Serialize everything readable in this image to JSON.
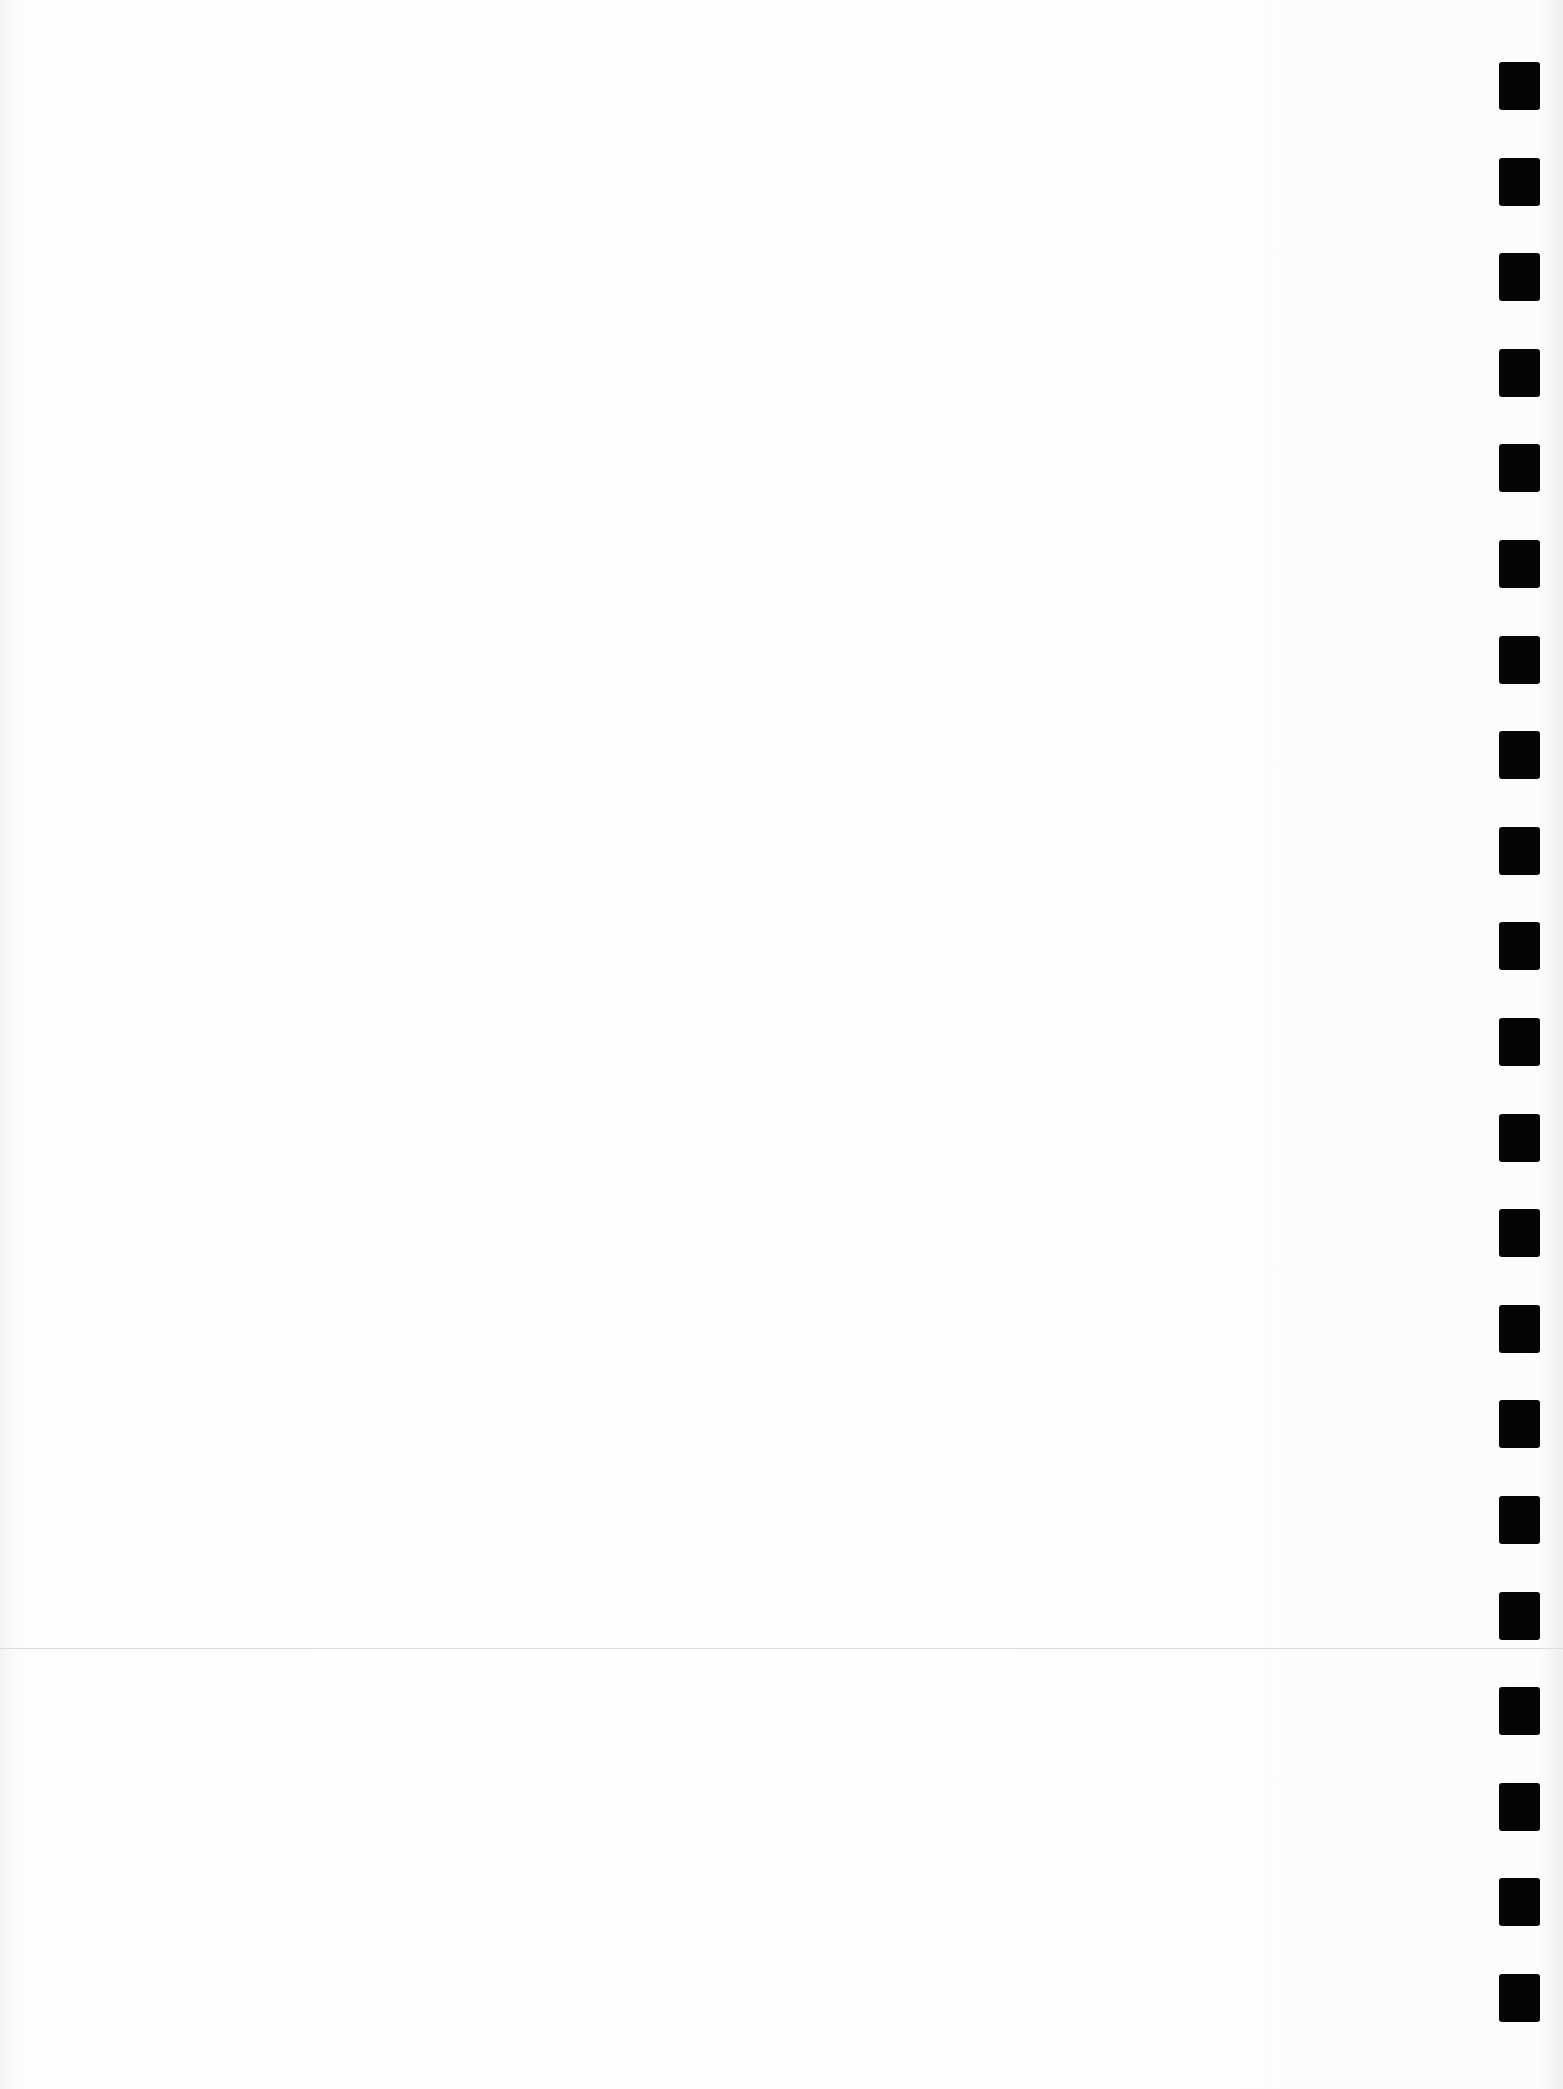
{
  "page": {
    "type": "scanned blank form page",
    "timing_marks": {
      "count": 21,
      "color": "#050505",
      "side": "right"
    },
    "divider_line": {
      "color": "#dcdcdc"
    }
  }
}
